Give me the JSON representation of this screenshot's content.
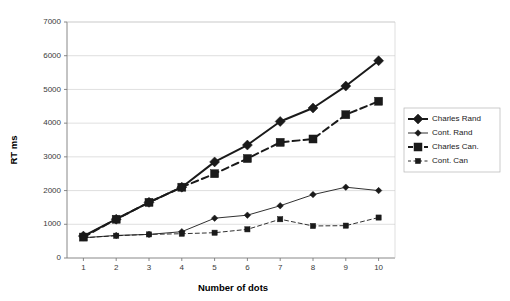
{
  "chart_data": {
    "type": "line",
    "title": "",
    "xlabel": "Number of dots",
    "ylabel": "RT ms",
    "x": [
      1,
      2,
      3,
      4,
      5,
      6,
      7,
      8,
      9,
      10
    ],
    "xtick_labels": [
      "1",
      "2",
      "3",
      "4",
      "5",
      "6",
      "7",
      "8",
      "9",
      "10"
    ],
    "ytick_labels": [
      "0",
      "1000",
      "2000",
      "3000",
      "4000",
      "5000",
      "6000",
      "7000"
    ],
    "yticks": [
      0,
      1000,
      2000,
      3000,
      4000,
      5000,
      6000,
      7000
    ],
    "xlim": [
      0.5,
      10.5
    ],
    "ylim": [
      0,
      7000
    ],
    "grid": "horizontal",
    "legend_position": "right",
    "series": [
      {
        "name": "Charles Rand",
        "marker": "diamond",
        "linestyle": "solid",
        "linewidth": 2.0,
        "markersize": 4.0,
        "color": "#1a1a1a",
        "values": [
          650,
          1150,
          1650,
          2100,
          2850,
          3350,
          4050,
          4450,
          5100,
          5850
        ]
      },
      {
        "name": "Cont. Rand",
        "marker": "diamond",
        "linestyle": "solid",
        "linewidth": 0.9,
        "markersize": 2.6,
        "color": "#1a1a1a",
        "values": [
          600,
          670,
          700,
          780,
          1180,
          1270,
          1550,
          1880,
          2100,
          2000
        ]
      },
      {
        "name": "Charles Can.",
        "marker": "square",
        "linestyle": "dashed",
        "linewidth": 2.0,
        "markersize": 4.0,
        "color": "#1a1a1a",
        "values": [
          620,
          1150,
          1650,
          2100,
          2500,
          2950,
          3430,
          3530,
          4250,
          4650
        ]
      },
      {
        "name": "Cont. Can",
        "marker": "square",
        "linestyle": "dashed",
        "linewidth": 0.9,
        "markersize": 2.6,
        "color": "#1a1a1a",
        "values": [
          600,
          660,
          700,
          720,
          750,
          850,
          1150,
          950,
          960,
          1200
        ]
      }
    ]
  }
}
